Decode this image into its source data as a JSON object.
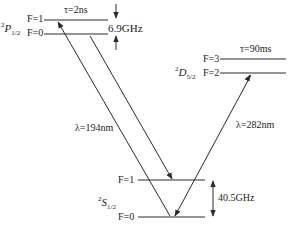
{
  "levels": {
    "P": {
      "term_sup": "2",
      "term_letter": "P",
      "term_sub": "1/2",
      "upper": "F=1",
      "lower": "F=0",
      "lifetime": "τ=2ns",
      "splitting": "6.9GHz"
    },
    "D": {
      "term_sup": "2",
      "term_letter": "D",
      "term_sub": "5/2",
      "upper": "F=3",
      "lower": "F=2",
      "lifetime": "τ=90ms"
    },
    "S": {
      "term_sup": "2",
      "term_letter": "S",
      "term_sub": "1/2",
      "upper": "F=1",
      "lower": "F=0",
      "splitting": "40.5GHz"
    }
  },
  "transitions": {
    "uv": "λ=194nm",
    "quadrupole": "λ=282nm"
  },
  "colors": {
    "line": "#2a2a2a"
  }
}
